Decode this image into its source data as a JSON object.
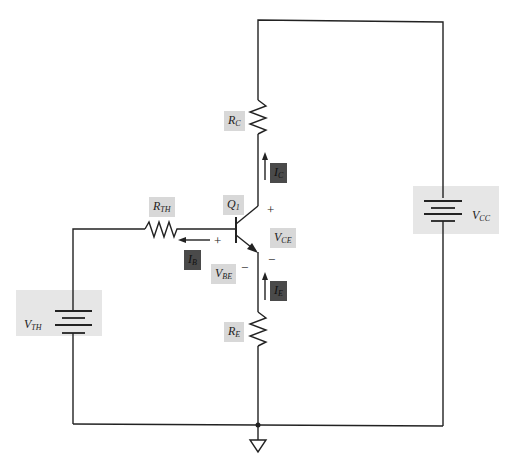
{
  "diagram": {
    "type": "BJT voltage-divider bias circuit (Thevenin equivalent)",
    "colors": {
      "wire": "#222222",
      "label_bg_light": "#d8d8d8",
      "label_bg_dark": "#4a4a4a",
      "source_bg": "#e6e6e6"
    },
    "labels": {
      "rc": {
        "main": "R",
        "sub": "C"
      },
      "re": {
        "main": "R",
        "sub": "E"
      },
      "rth": {
        "main": "R",
        "sub": "TH"
      },
      "q1": {
        "main": "Q",
        "sub": "1"
      },
      "ic": {
        "main": "I",
        "sub": "C"
      },
      "ib": {
        "main": "I",
        "sub": "B"
      },
      "ie": {
        "main": "I",
        "sub": "E"
      },
      "vce": {
        "main": "V",
        "sub": "CE"
      },
      "vbe": {
        "main": "V",
        "sub": "BE"
      },
      "vcc": {
        "main": "V",
        "sub": "CC"
      },
      "vth": {
        "main": "V",
        "sub": "TH"
      }
    },
    "signs": {
      "vce_plus": "+",
      "vce_minus": "−",
      "vbe_plus": "+",
      "vbe_minus": "−"
    }
  }
}
